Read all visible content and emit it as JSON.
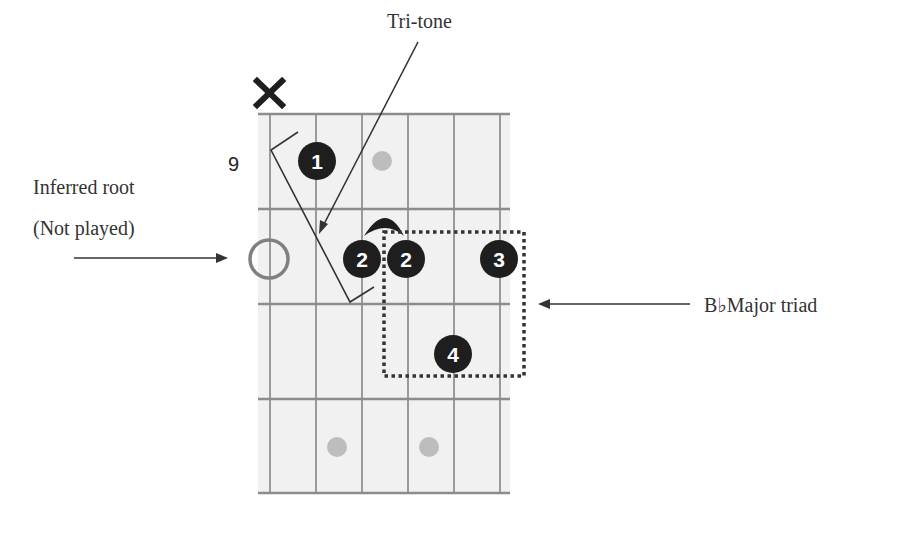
{
  "diagram": {
    "type": "guitar-chord-diagram",
    "fret_position_label": "9",
    "muted_string_marker": "✕",
    "strings": 6,
    "frets_shown": 4,
    "colors": {
      "fretboard_bg": "#f1f1f1",
      "grid_line": "#8c8c8c",
      "finger_dot": "#1e1e1e",
      "finger_text": "#ffffff",
      "inlay_dot": "#bdbdbd",
      "root_circle": "#808080",
      "annotation_line": "#333333"
    },
    "finger_dots": [
      {
        "finger": "1",
        "string": 2,
        "fret": 1
      },
      {
        "finger": "2",
        "string": 3,
        "fret": 2
      },
      {
        "finger": "2",
        "string": 4,
        "fret": 2
      },
      {
        "finger": "3",
        "string": 6,
        "fret": 2
      },
      {
        "finger": "4",
        "string": 5,
        "fret": 3
      }
    ],
    "inlay_dots": [
      {
        "string": 3.5,
        "fret": 1
      },
      {
        "string": 2.5,
        "fret": 4
      },
      {
        "string": 4.5,
        "fret": 4
      }
    ],
    "barre": {
      "from_string": 3,
      "to_string": 4,
      "fret": 2
    },
    "inferred_root": {
      "string": 1,
      "fret": 2
    }
  },
  "annotations": {
    "tritone_label": "Tri-tone",
    "inferred_root_line1": "Inferred root",
    "inferred_root_line2": "(Not played)",
    "triad_label": "B♭Major triad"
  },
  "fingers": {
    "f1": "1",
    "f2a": "2",
    "f2b": "2",
    "f3": "3",
    "f4": "4"
  }
}
